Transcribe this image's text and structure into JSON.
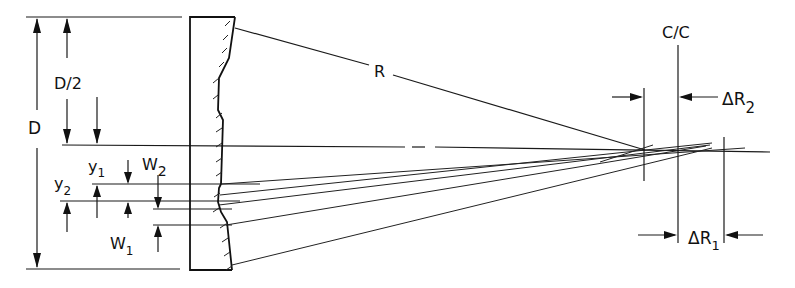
{
  "diagram": {
    "labels": {
      "D": "D",
      "D_half": "D/2",
      "R": "R",
      "cc": "C/C",
      "delta_R2": "ΔR",
      "delta_R2_sub": "2",
      "delta_R1": "ΔR",
      "delta_R1_sub": "1",
      "y1": "y",
      "y1_sub": "1",
      "y2": "y",
      "y2_sub": "2",
      "W2": "W",
      "W2_sub": "2",
      "W1": "W",
      "W1_sub": "1"
    },
    "colors": {
      "line": "#1a1a1a",
      "background": "#ffffff"
    }
  }
}
